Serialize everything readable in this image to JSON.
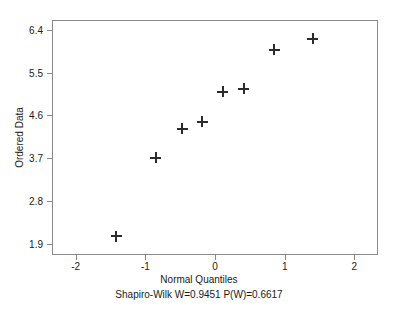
{
  "chart_data": {
    "type": "scatter",
    "title": "",
    "subtitle": "Shapiro-Wilk W=0.9451  P(W)=0.6617",
    "xlabel": "Normal Quantiles",
    "ylabel": "Ordered Data",
    "xlim": [
      -2.34,
      2.34
    ],
    "ylim": [
      1.66,
      6.61
    ],
    "grid": false,
    "legend": null,
    "marker": "plus",
    "marker_color": "#2b2b2b",
    "xticks": [
      -2,
      -1,
      0,
      1,
      2
    ],
    "xtick_labels": [
      "-2",
      "-1",
      "0",
      "1",
      "2"
    ],
    "yticks": [
      1.9,
      2.8,
      3.7,
      4.6,
      5.5,
      6.4
    ],
    "ytick_labels": [
      "1.9",
      "2.8",
      "3.7",
      "4.6",
      "5.5",
      "6.4"
    ],
    "x": [
      -1.42,
      -0.85,
      -0.47,
      -0.18,
      0.11,
      0.41,
      0.85,
      1.4
    ],
    "y": [
      2.06,
      3.71,
      4.32,
      4.47,
      5.1,
      5.16,
      5.98,
      6.21
    ],
    "points": [
      {
        "x": -1.42,
        "y": 2.06
      },
      {
        "x": -0.85,
        "y": 3.71
      },
      {
        "x": -0.47,
        "y": 4.32
      },
      {
        "x": -0.18,
        "y": 4.47
      },
      {
        "x": 0.11,
        "y": 5.1
      },
      {
        "x": 0.41,
        "y": 5.16
      },
      {
        "x": 0.85,
        "y": 5.98
      },
      {
        "x": 1.4,
        "y": 6.21
      }
    ],
    "annotations": {
      "shapiro_wilk_w": "0.9451",
      "p_value": "0.6617"
    }
  },
  "colors": {
    "background": "#ffffff",
    "frame": "#8a8a8a",
    "text": "#1a1a1a",
    "marker": "#2b2b2b"
  }
}
